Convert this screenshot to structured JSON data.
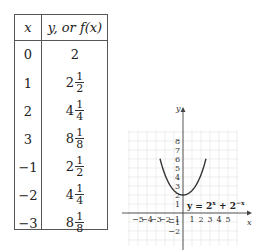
{
  "table": {
    "headers": {
      "x": "x",
      "y": "y,  or f(x)"
    },
    "rows": [
      {
        "x": "0",
        "whole": "2",
        "num": "",
        "den": ""
      },
      {
        "x": "1",
        "whole": "2",
        "num": "1",
        "den": "2"
      },
      {
        "x": "2",
        "whole": "4",
        "num": "1",
        "den": "4"
      },
      {
        "x": "3",
        "whole": "8",
        "num": "1",
        "den": "8"
      },
      {
        "x": "−1",
        "whole": "2",
        "num": "1",
        "den": "2"
      },
      {
        "x": "−2",
        "whole": "4",
        "num": "1",
        "den": "4"
      },
      {
        "x": "−3",
        "whole": "8",
        "num": "1",
        "den": "8"
      }
    ]
  },
  "chart_data": {
    "type": "line",
    "title": "",
    "equation_label": "y = 2^x + 2^-x",
    "xlabel": "x",
    "ylabel": "y",
    "x_ticks": [
      "-5",
      "-4",
      "-3",
      "-2",
      "-1",
      "1",
      "2",
      "3",
      "4",
      "5"
    ],
    "y_ticks": [
      "-2",
      "-1",
      "1",
      "2",
      "3",
      "4",
      "5",
      "6",
      "7",
      "8"
    ],
    "xlim": [
      -6,
      6
    ],
    "ylim": [
      -3,
      9
    ],
    "grid": true,
    "series": [
      {
        "name": "y = 2^x + 2^-x",
        "x": [
          -3,
          -2,
          -1,
          0,
          1,
          2,
          3
        ],
        "y": [
          8.125,
          4.25,
          2.5,
          2,
          2.5,
          4.25,
          8.125
        ]
      }
    ]
  },
  "graph": {
    "x_axis_label": "x",
    "y_axis_label": "y",
    "equation": {
      "lhs": "y = 2",
      "sup1": "x",
      "plus": " + 2",
      "sup2": "−x"
    }
  }
}
